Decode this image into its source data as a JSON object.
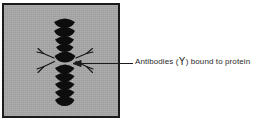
{
  "figure": {
    "type": "labeled-micrograph-diagram",
    "panel": {
      "name": "electron-micrograph-panel",
      "fill_color": "#a8a8a8",
      "border_color": "#1b1b1b",
      "subject": "protein filament with bound antibodies"
    },
    "callout": {
      "label_prefix": "Antibodies (",
      "label_glyph": "Y",
      "label_suffix": ") bound to protein",
      "full_text": "Antibodies ( Y ) bound to protein",
      "leader_color": "#1b1b1b",
      "arrow_target": "central antibody cluster"
    },
    "specimen": {
      "filament_label": "protein subunit stack",
      "subunit_count": 10,
      "subunit_color": "#0d0d0d",
      "antibody_count": 4,
      "antibody_color": "#141414"
    }
  }
}
